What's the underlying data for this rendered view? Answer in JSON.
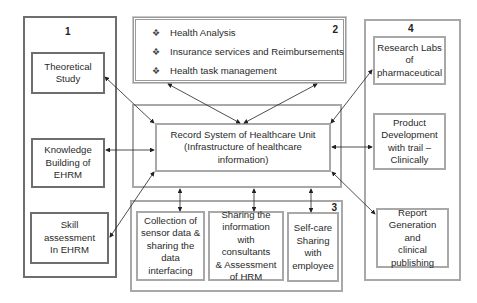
{
  "group1": {
    "number": "1",
    "items": [
      {
        "label": "Theoretical\nStudy"
      },
      {
        "label": "Knowledge\nBuilding of\nEHRM"
      },
      {
        "label": "Skill assessment\nIn EHRM"
      }
    ]
  },
  "group2": {
    "number": "2",
    "bullet_icon": "diamond-bullet",
    "items": [
      {
        "label": "Health Analysis"
      },
      {
        "label": "Insurance services and Reimbursements"
      },
      {
        "label": "Health task management"
      }
    ]
  },
  "center": {
    "line1": "Record System of Healthcare Unit",
    "line2": "(Infrastructure of healthcare information)"
  },
  "group3": {
    "number": "3",
    "items": [
      {
        "label": "Collection of\nsensor data &\nsharing the\ndata\ninterfacing"
      },
      {
        "label": "Sharing the\ninformation\nwith consultants\n& Assessment\nof HRM"
      },
      {
        "label": "Self-care\nSharing\nwith\nemployee"
      }
    ]
  },
  "group4": {
    "number": "4",
    "items": [
      {
        "label": "Research Labs\nof\npharmaceutical"
      },
      {
        "label": "Product\nDevelopment\nwith trail –\nClinically"
      },
      {
        "label": "Report\nGeneration and\nclinical\npublishing"
      }
    ]
  },
  "colors": {
    "dark_border": "#6e6e6e",
    "light_border": "#a8a8a8",
    "arrow": "#222222"
  }
}
